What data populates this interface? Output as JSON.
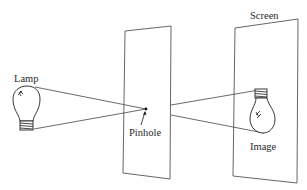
{
  "diagram": {
    "labels": {
      "lamp": "Lamp",
      "pinhole": "Pinhole",
      "screen": "Screen",
      "image": "Image"
    },
    "colors": {
      "line": "#333333",
      "background": "#ffffff"
    }
  }
}
